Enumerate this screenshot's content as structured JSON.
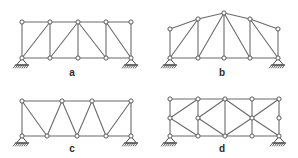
{
  "figure": {
    "background_color": "#ffffff",
    "member_color": "#6b6b6b",
    "joint_fill": "#ffffff",
    "joint_stroke": "#5a5a5a",
    "support_color": "#4d4d4d",
    "label_color": "#2b2b2b"
  },
  "panels": [
    {
      "id": "a",
      "label": "a",
      "label_pos": {
        "x": 72,
        "y": 76
      },
      "type": "pratt-parallel-chord-truss",
      "description": "Parallel chord truss with vertical posts and diagonals",
      "joints": [
        {
          "name": "L0",
          "x": 22,
          "y": 58
        },
        {
          "name": "L1",
          "x": 50,
          "y": 58
        },
        {
          "name": "L2",
          "x": 78,
          "y": 58
        },
        {
          "name": "L3",
          "x": 106,
          "y": 58
        },
        {
          "name": "L4",
          "x": 131,
          "y": 58
        },
        {
          "name": "U0",
          "x": 22,
          "y": 22
        },
        {
          "name": "U1",
          "x": 50,
          "y": 22
        },
        {
          "name": "U2",
          "x": 78,
          "y": 22
        },
        {
          "name": "U3",
          "x": 106,
          "y": 22
        },
        {
          "name": "U4",
          "x": 131,
          "y": 22
        }
      ],
      "members": [
        [
          "U0",
          "U1"
        ],
        [
          "U1",
          "U2"
        ],
        [
          "U2",
          "U3"
        ],
        [
          "U3",
          "U4"
        ],
        [
          "L0",
          "L1"
        ],
        [
          "L1",
          "L2"
        ],
        [
          "L2",
          "L3"
        ],
        [
          "L3",
          "L4"
        ],
        [
          "U0",
          "L0"
        ],
        [
          "U1",
          "L1"
        ],
        [
          "U2",
          "L2"
        ],
        [
          "U3",
          "L3"
        ],
        [
          "U4",
          "L4"
        ],
        [
          "L0",
          "U1"
        ],
        [
          "L1",
          "U2"
        ],
        [
          "U2",
          "L3"
        ],
        [
          "U3",
          "L4"
        ]
      ],
      "supports": [
        {
          "kind": "pin",
          "at": "L0"
        },
        {
          "kind": "pin",
          "at": "L4"
        }
      ]
    },
    {
      "id": "b",
      "label": "b",
      "label_pos": {
        "x": 222,
        "y": 76
      },
      "type": "bowstring-arched-top-chord-truss",
      "description": "Arched (polygonal) top chord truss with verticals and diagonals",
      "joints": [
        {
          "name": "L0",
          "x": 170,
          "y": 58
        },
        {
          "name": "L1",
          "x": 198,
          "y": 58
        },
        {
          "name": "L2",
          "x": 224,
          "y": 58
        },
        {
          "name": "L3",
          "x": 250,
          "y": 58
        },
        {
          "name": "L4",
          "x": 278,
          "y": 58
        },
        {
          "name": "U0",
          "x": 170,
          "y": 29
        },
        {
          "name": "U1",
          "x": 198,
          "y": 19
        },
        {
          "name": "U2",
          "x": 224,
          "y": 13
        },
        {
          "name": "U3",
          "x": 250,
          "y": 19
        },
        {
          "name": "U4",
          "x": 278,
          "y": 29
        }
      ],
      "members": [
        [
          "U0",
          "U1"
        ],
        [
          "U1",
          "U2"
        ],
        [
          "U2",
          "U3"
        ],
        [
          "U3",
          "U4"
        ],
        [
          "L0",
          "L1"
        ],
        [
          "L1",
          "L2"
        ],
        [
          "L2",
          "L3"
        ],
        [
          "L3",
          "L4"
        ],
        [
          "U0",
          "L0"
        ],
        [
          "U1",
          "L1"
        ],
        [
          "U2",
          "L2"
        ],
        [
          "U3",
          "L3"
        ],
        [
          "U4",
          "L4"
        ],
        [
          "L0",
          "U1"
        ],
        [
          "L1",
          "U2"
        ],
        [
          "U2",
          "L3"
        ],
        [
          "U3",
          "L4"
        ]
      ],
      "supports": [
        {
          "kind": "pin",
          "at": "L0"
        },
        {
          "kind": "pin",
          "at": "L4"
        }
      ]
    },
    {
      "id": "c",
      "label": "c",
      "label_pos": {
        "x": 72,
        "y": 152
      },
      "type": "warren-truss",
      "description": "Warren truss with zigzag diagonals and end verticals",
      "joints": [
        {
          "name": "L0",
          "x": 22,
          "y": 136
        },
        {
          "name": "L1",
          "x": 47,
          "y": 136
        },
        {
          "name": "L2",
          "x": 77,
          "y": 136
        },
        {
          "name": "L3",
          "x": 106,
          "y": 136
        },
        {
          "name": "L4",
          "x": 131,
          "y": 136
        },
        {
          "name": "U0",
          "x": 22,
          "y": 101
        },
        {
          "name": "U1",
          "x": 62,
          "y": 101
        },
        {
          "name": "U2",
          "x": 92,
          "y": 101
        },
        {
          "name": "U3",
          "x": 131,
          "y": 101
        }
      ],
      "members": [
        [
          "U0",
          "U1"
        ],
        [
          "U1",
          "U2"
        ],
        [
          "U2",
          "U3"
        ],
        [
          "L0",
          "L1"
        ],
        [
          "L1",
          "L2"
        ],
        [
          "L2",
          "L3"
        ],
        [
          "L3",
          "L4"
        ],
        [
          "U0",
          "L0"
        ],
        [
          "U3",
          "L4"
        ],
        [
          "U0",
          "L1"
        ],
        [
          "L1",
          "U1"
        ],
        [
          "U1",
          "L2"
        ],
        [
          "L2",
          "U2"
        ],
        [
          "U2",
          "L3"
        ],
        [
          "L3",
          "U3"
        ]
      ],
      "supports": [
        {
          "kind": "pin",
          "at": "L0"
        },
        {
          "kind": "pin",
          "at": "L4"
        }
      ]
    },
    {
      "id": "d",
      "label": "d",
      "label_pos": {
        "x": 222,
        "y": 152
      },
      "type": "double-layer-lattice-truss",
      "description": "Parallel chord truss with intermediate middle chord and lattice diagonals",
      "joints": [
        {
          "name": "L0",
          "x": 170,
          "y": 136
        },
        {
          "name": "L1",
          "x": 198,
          "y": 136
        },
        {
          "name": "L2",
          "x": 225,
          "y": 136
        },
        {
          "name": "L3",
          "x": 252,
          "y": 136
        },
        {
          "name": "L4",
          "x": 279,
          "y": 136
        },
        {
          "name": "M0",
          "x": 170,
          "y": 118
        },
        {
          "name": "M1",
          "x": 198,
          "y": 118
        },
        {
          "name": "M2",
          "x": 252,
          "y": 118
        },
        {
          "name": "M3",
          "x": 279,
          "y": 118
        },
        {
          "name": "U0",
          "x": 170,
          "y": 99
        },
        {
          "name": "U1",
          "x": 198,
          "y": 99
        },
        {
          "name": "U2",
          "x": 225,
          "y": 99
        },
        {
          "name": "U3",
          "x": 252,
          "y": 99
        },
        {
          "name": "U4",
          "x": 279,
          "y": 99
        }
      ],
      "members": [
        [
          "U0",
          "U1"
        ],
        [
          "U1",
          "U2"
        ],
        [
          "U2",
          "U3"
        ],
        [
          "U3",
          "U4"
        ],
        [
          "L0",
          "L1"
        ],
        [
          "L1",
          "L2"
        ],
        [
          "L2",
          "L3"
        ],
        [
          "L3",
          "L4"
        ],
        [
          "U0",
          "M0"
        ],
        [
          "M0",
          "L0"
        ],
        [
          "U1",
          "M1"
        ],
        [
          "M1",
          "L1"
        ],
        [
          "U2",
          "L2"
        ],
        [
          "U3",
          "M2"
        ],
        [
          "M2",
          "L3"
        ],
        [
          "U4",
          "M3"
        ],
        [
          "M3",
          "L4"
        ],
        [
          "M0",
          "U1"
        ],
        [
          "M0",
          "L1"
        ],
        [
          "M1",
          "U2"
        ],
        [
          "M1",
          "L2"
        ],
        [
          "U2",
          "M2"
        ],
        [
          "L2",
          "M2"
        ],
        [
          "M2",
          "U4"
        ],
        [
          "M2",
          "L4"
        ]
      ],
      "supports": [
        {
          "kind": "pin",
          "at": "L0"
        },
        {
          "kind": "pin",
          "at": "L4"
        }
      ]
    }
  ]
}
